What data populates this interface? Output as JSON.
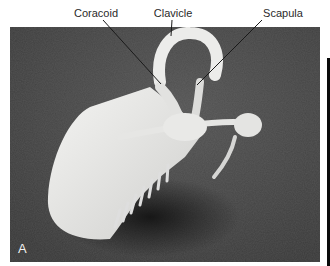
{
  "figure": {
    "panel_label": "A",
    "labels": [
      {
        "text": "Coracoid",
        "x": 96,
        "y": 7
      },
      {
        "text": "Clavicle",
        "x": 173,
        "y": 7
      },
      {
        "text": "Scapula",
        "x": 283,
        "y": 7
      }
    ],
    "colors": {
      "background": "#4a4a4a",
      "bone": "#e8e8e6",
      "label_text": "#2a2a2a",
      "leader_line": "#1a1a1a"
    }
  }
}
